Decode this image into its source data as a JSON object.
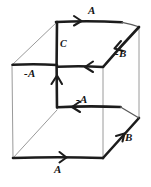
{
  "figure": {
    "type": "vector-cube-sketch",
    "ink_color": "#1c1c1c",
    "hidden_edge_color": "#9a9a9a",
    "background_color": "#ffffff",
    "width": 151,
    "height": 187
  },
  "labels": {
    "top_edge": "A",
    "upper_right_diagonal": "-B",
    "front_vertical": "C",
    "left_horizontal": "-A",
    "middle_horizontal": "-A",
    "lower_horizontal": "-A",
    "lower_right_diagonal": "B",
    "bottom_edge": "A"
  },
  "vectors": [
    {
      "name": "top-edge-vector",
      "label": "A",
      "direction": "right",
      "x1": 57,
      "y1": 22,
      "x2": 122,
      "y2": 22
    },
    {
      "name": "upper-right-diagonal-vector",
      "label": "-B",
      "direction": "down-left",
      "x1": 139,
      "y1": 27,
      "x2": 103,
      "y2": 67
    },
    {
      "name": "front-vertical-vector",
      "label": "C",
      "direction": "up",
      "x1": 57,
      "y1": 107,
      "x2": 57,
      "y2": 22
    },
    {
      "name": "left-horizontal-vector",
      "label": "-A",
      "direction": "left",
      "x1": 57,
      "y1": 65,
      "x2": 12,
      "y2": 65
    },
    {
      "name": "middle-horizontal-vector",
      "label": "-A",
      "direction": "left",
      "x1": 103,
      "y1": 67,
      "x2": 57,
      "y2": 67
    },
    {
      "name": "lower-horizontal-vector",
      "label": "-A",
      "direction": "left",
      "x1": 120,
      "y1": 107,
      "x2": 57,
      "y2": 107
    },
    {
      "name": "lower-right-diagonal-vector",
      "label": "B",
      "direction": "up-right",
      "x1": 103,
      "y1": 158,
      "x2": 139,
      "y2": 118
    },
    {
      "name": "bottom-edge-vector",
      "label": "A",
      "direction": "right",
      "x1": 13,
      "y1": 158,
      "x2": 103,
      "y2": 158
    }
  ],
  "label_positions": [
    {
      "key": "top_edge",
      "text": "A",
      "left": 88,
      "top": 6,
      "size": "normal"
    },
    {
      "key": "upper_right_diagonal",
      "text": "-B",
      "left": 115,
      "top": 50,
      "size": "normal"
    },
    {
      "key": "front_vertical",
      "text": "C",
      "left": 60,
      "top": 40,
      "size": "small"
    },
    {
      "key": "left_horizontal",
      "text": "-A",
      "left": 24,
      "top": 68,
      "size": "normal"
    },
    {
      "key": "middle_horizontal",
      "text": "-A",
      "left": 76,
      "top": 95,
      "size": "normal"
    },
    {
      "key": "lower_right_diagonal",
      "text": "B",
      "left": 125,
      "top": 133,
      "size": "normal"
    },
    {
      "key": "bottom_edge",
      "text": "A",
      "left": 54,
      "top": 165,
      "size": "normal"
    }
  ]
}
